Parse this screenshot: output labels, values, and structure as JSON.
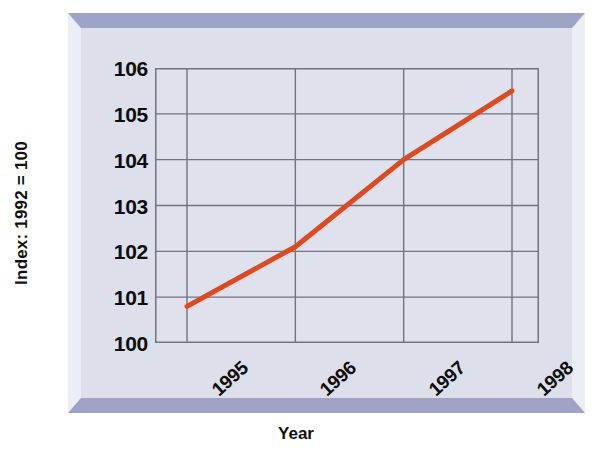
{
  "chart_data": {
    "type": "line",
    "title": "",
    "xlabel": "Year",
    "ylabel": "Index: 1992 = 100",
    "x": [
      "1995",
      "1996",
      "1997",
      "1998"
    ],
    "categories": [
      "1995",
      "1996",
      "1997",
      "1998"
    ],
    "series": [
      {
        "name": "Index",
        "values": [
          100.8,
          102.1,
          104.0,
          105.5
        ],
        "color": "#e2481e"
      }
    ],
    "xlim": [
      "1995",
      "1998"
    ],
    "ylim": [
      100,
      106
    ],
    "ytick_labels": [
      "106",
      "105",
      "104",
      "103",
      "102",
      "101",
      "100"
    ],
    "ytick_values": [
      106,
      105,
      104,
      103,
      102,
      101,
      100
    ],
    "xtick_labels": [
      "1995",
      "1996",
      "1997",
      "1998"
    ],
    "grid": true,
    "grid_color": "#6f7382",
    "legend": "none",
    "plot_background": "#dfe2ec",
    "frame_band_color": "#9fa3c6",
    "frame_face_color": "#dde0ea"
  },
  "axes": {
    "y_title": "Index: 1992 = 100",
    "x_title": "Year"
  }
}
